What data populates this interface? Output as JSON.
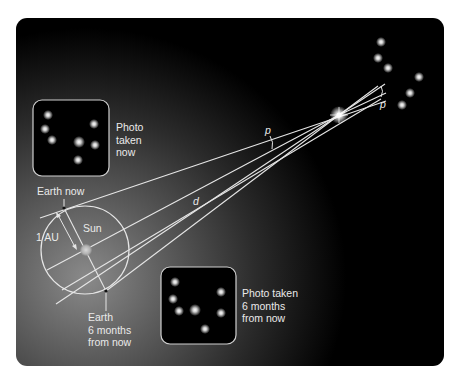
{
  "diagram": {
    "colors": {
      "background": "#000000",
      "glow": "#8a8a8a",
      "lines": "#e6e6e6",
      "text": "#eaeaea"
    },
    "labels": {
      "photo_now": [
        "Photo",
        "taken",
        "now"
      ],
      "photo_later": [
        "Photo taken",
        "6 months",
        "from now"
      ],
      "earth_now": "Earth now",
      "earth_later": [
        "Earth",
        "6 months",
        "from now"
      ],
      "sun": "Sun",
      "au": "1 AU",
      "distance": "d",
      "parallax_angle": "p",
      "parallax_angle_far": "p"
    },
    "elements": {
      "nearby_star": {
        "x": 339,
        "y": 115
      },
      "sun": {
        "x": 86,
        "y": 250
      },
      "orbit": {
        "cx": 85,
        "cy": 250,
        "r": 44
      },
      "earth_now": {
        "x": 64,
        "y": 208
      },
      "earth_later": {
        "x": 106,
        "y": 291
      },
      "background_stars": [
        [
          381,
          42
        ],
        [
          378,
          58
        ],
        [
          388,
          68
        ],
        [
          419,
          77
        ],
        [
          410,
          93
        ],
        [
          402,
          105
        ]
      ],
      "photo_now_stars": [
        [
          48,
          115
        ],
        [
          45,
          129
        ],
        [
          52,
          140
        ],
        [
          94,
          124
        ],
        [
          79,
          142
        ],
        [
          95,
          145
        ],
        [
          78,
          160
        ]
      ],
      "photo_later_stars": [
        [
          175,
          282
        ],
        [
          173,
          299
        ],
        [
          179,
          311
        ],
        [
          195,
          310
        ],
        [
          221,
          292
        ],
        [
          221,
          313
        ],
        [
          205,
          329
        ]
      ]
    }
  }
}
